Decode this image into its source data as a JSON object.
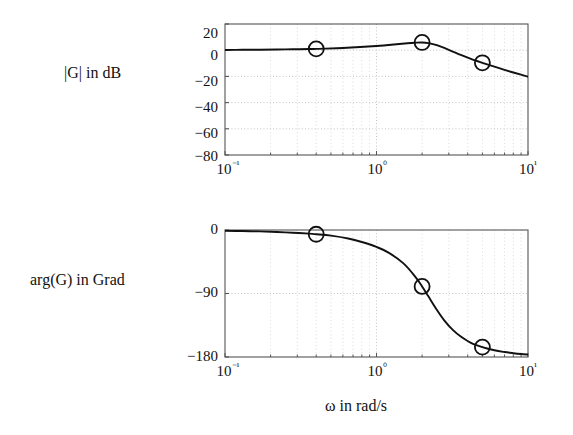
{
  "figure": {
    "kind": "bode-diagram",
    "background": "#ffffff",
    "line_color": "#111111",
    "grid_color": "#bbbbbb",
    "frame_color": "#555555"
  },
  "labels": {
    "magnitude_axis": "|G| in dB",
    "phase_axis": "arg(G)  in Grad",
    "x_axis": "ω  in rad/s"
  },
  "chart_data": [
    {
      "type": "line",
      "name": "magnitude",
      "title": "",
      "xlabel": "ω  in rad/s",
      "ylabel": "|G| in dB",
      "xscale": "log",
      "xlim": [
        0.1,
        10
      ],
      "ylim": [
        -80,
        20
      ],
      "xticks": [
        0.1,
        1,
        10
      ],
      "xticklabels": [
        "10⁻¹",
        "10⁰",
        "10¹"
      ],
      "yticks": [
        20,
        0,
        -20,
        -40,
        -60,
        -80
      ],
      "yticklabels": [
        "20",
        "0",
        "−20",
        "−40",
        "−60",
        "−80"
      ],
      "grid": true,
      "legend": "none",
      "x": [
        0.1,
        0.13,
        0.17,
        0.22,
        0.28,
        0.36,
        0.4,
        0.46,
        0.6,
        0.78,
        1.0,
        1.3,
        1.6,
        1.8,
        2.0,
        2.2,
        2.5,
        3.0,
        3.6,
        4.2,
        5.0,
        6.0,
        7.0,
        8.0,
        9.0,
        10.0
      ],
      "y": [
        0.2,
        0.3,
        0.4,
        0.5,
        0.7,
        0.9,
        1.0,
        1.2,
        1.7,
        2.4,
        3.2,
        4.3,
        5.3,
        5.7,
        5.9,
        5.4,
        3.8,
        0.3,
        -3.6,
        -6.6,
        -9.6,
        -12.6,
        -15.0,
        -17.0,
        -18.7,
        -20.2
      ],
      "markers": [
        {
          "x": 0.4,
          "y": 1.0
        },
        {
          "x": 2.0,
          "y": 5.9
        },
        {
          "x": 5.0,
          "y": -9.6
        }
      ]
    },
    {
      "type": "line",
      "name": "phase",
      "title": "",
      "xlabel": "ω  in rad/s",
      "ylabel": "arg(G)  in Grad",
      "xscale": "log",
      "xlim": [
        0.1,
        10
      ],
      "ylim": [
        -180,
        0
      ],
      "xticks": [
        0.1,
        1,
        10
      ],
      "xticklabels": [
        "10⁻¹",
        "10⁰",
        "10¹"
      ],
      "yticks": [
        0,
        -90,
        -180
      ],
      "yticklabels": [
        "0",
        "−90",
        "−180"
      ],
      "grid": true,
      "legend": "none",
      "x": [
        0.1,
        0.13,
        0.17,
        0.22,
        0.28,
        0.36,
        0.4,
        0.5,
        0.65,
        0.8,
        1.0,
        1.2,
        1.5,
        1.8,
        2.0,
        2.2,
        2.5,
        2.8,
        3.2,
        3.6,
        4.2,
        5.0,
        6.0,
        7.0,
        8.0,
        9.0,
        10.0
      ],
      "y": [
        -1.0,
        -1.5,
        -2.0,
        -2.8,
        -3.8,
        -5.2,
        -6.0,
        -8.0,
        -12.0,
        -17.0,
        -24.0,
        -32.0,
        -47.0,
        -66.0,
        -80.0,
        -94.0,
        -113.0,
        -128.0,
        -142.0,
        -151.0,
        -160.0,
        -166.0,
        -170.5,
        -173.0,
        -174.6,
        -175.8,
        -176.6
      ],
      "markers": [
        {
          "x": 0.4,
          "y": -6.0
        },
        {
          "x": 2.0,
          "y": -80.0
        },
        {
          "x": 5.0,
          "y": -166.0
        }
      ]
    }
  ]
}
